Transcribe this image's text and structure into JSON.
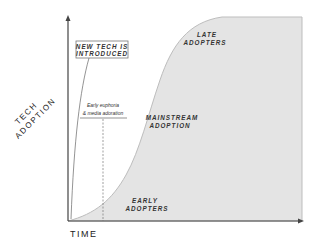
{
  "diagram": {
    "type": "adoption-s-curve",
    "axes": {
      "x_label": "TIME",
      "y_label_line1": "TECH",
      "y_label_line2": "ADOPTION"
    },
    "annotations": {
      "intro_line1": "NEW TECH IS",
      "intro_line2": "INTRODUCED",
      "euphoria_line1": "Early euphoria",
      "euphoria_line2": "& media adoration"
    },
    "regions": {
      "early_line1": "EARLY",
      "early_line2": "ADOPTERS",
      "mainstream_line1": "MAINSTREAM",
      "mainstream_line2": "ADOPTION",
      "late_line1": "LATE",
      "late_line2": "ADOPTERS"
    },
    "colors": {
      "fill": "#e4e4e4",
      "axis": "#444444",
      "curve_edge": "#bdbdbd"
    }
  }
}
